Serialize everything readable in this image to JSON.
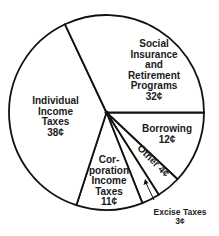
{
  "chart_data": {
    "type": "pie",
    "title": "",
    "unit": "cents per dollar",
    "start_angle_deg": 0,
    "direction": "clockwise",
    "slices": [
      {
        "label": "Borrowing",
        "value": 12,
        "display": "12¢"
      },
      {
        "label": "Other",
        "value": 4,
        "display": "4¢"
      },
      {
        "label": "Excise Taxes",
        "value": 3,
        "display": "3¢"
      },
      {
        "label": "Corporation Income Taxes",
        "value": 11,
        "display": "11¢"
      },
      {
        "label": "Individual Income Taxes",
        "value": 38,
        "display": "38¢"
      },
      {
        "label": "Social Insurance and Retirement Programs",
        "value": 32,
        "display": "32¢"
      }
    ],
    "colors": {
      "fill": "#ffffff",
      "stroke": "#111111",
      "text": "#1a1a1a"
    }
  },
  "labels": {
    "social": "Social\nInsurance\nand\nRetirement\nPrograms\n32¢",
    "individual": "Individual\nIncome\nTaxes\n38¢",
    "borrowing": "Borrowing\n12¢",
    "other": "Other 4¢",
    "corporation": "Cor-\nporation\nIncome\nTaxes\n11¢",
    "excise": "Excise Taxes\n3¢"
  }
}
